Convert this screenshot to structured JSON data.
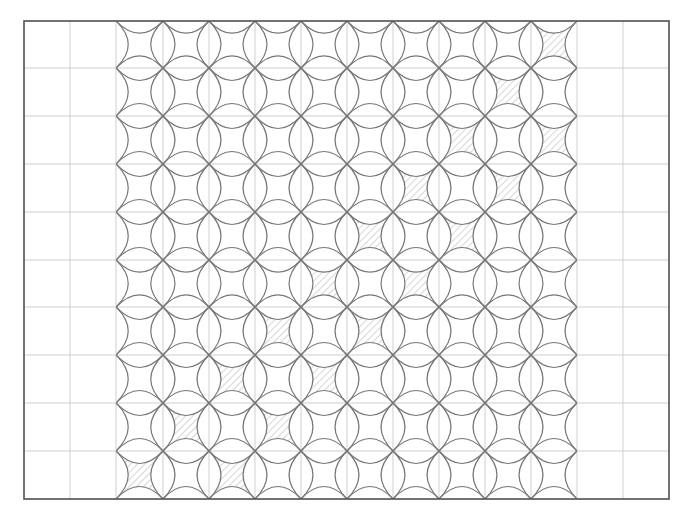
{
  "diagram": {
    "type": "quilt-pattern",
    "frame": {
      "x0": 24,
      "y0": 21,
      "x1": 669,
      "y1": 499,
      "stroke": "#555555"
    },
    "grid": {
      "x_lines": [
        24,
        70,
        116,
        163,
        209,
        255,
        301,
        347,
        393,
        439,
        485,
        531,
        577,
        623,
        669
      ],
      "y_lines": [
        21,
        68,
        116,
        164,
        212,
        260,
        307,
        355,
        403,
        451,
        499
      ],
      "stroke": "#cfcfcf"
    },
    "pattern": {
      "col_start_index": 2,
      "col_end_index": 12,
      "rows": 10,
      "cols": 10,
      "arc_stroke": "#777777",
      "lens_bulge_ratio": 0.26,
      "hatch_color": "#b5b5b5",
      "hatch_direction": "backslash",
      "shaded_cells": [
        {
          "row": 0,
          "col": 9
        },
        {
          "row": 1,
          "col": 8
        },
        {
          "row": 2,
          "col": 7
        },
        {
          "row": 2,
          "col": 9
        },
        {
          "row": 3,
          "col": 6
        },
        {
          "row": 3,
          "col": 8
        },
        {
          "row": 4,
          "col": 5
        },
        {
          "row": 4,
          "col": 7
        },
        {
          "row": 5,
          "col": 4
        },
        {
          "row": 5,
          "col": 6
        },
        {
          "row": 6,
          "col": 3
        },
        {
          "row": 6,
          "col": 5
        },
        {
          "row": 7,
          "col": 2
        },
        {
          "row": 7,
          "col": 4
        },
        {
          "row": 8,
          "col": 1
        },
        {
          "row": 8,
          "col": 3
        },
        {
          "row": 9,
          "col": 0
        },
        {
          "row": 9,
          "col": 2
        }
      ]
    }
  }
}
